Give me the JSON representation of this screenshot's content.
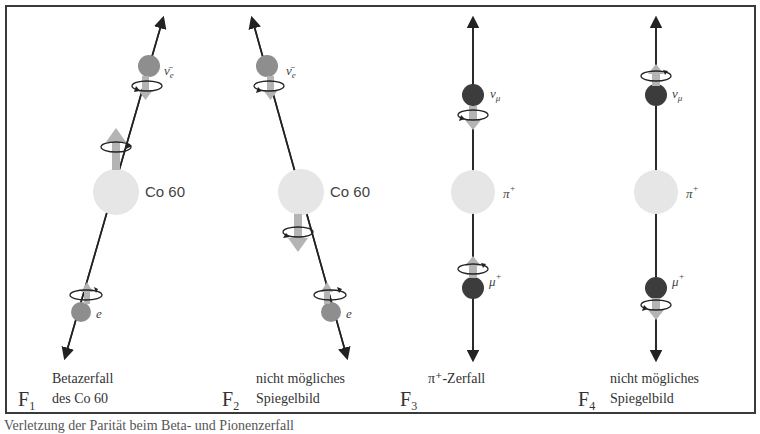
{
  "panels": [
    {
      "id": "F1",
      "figure_label": "F",
      "figure_index": "1",
      "caption_line1": "Betazerfall",
      "caption_line2": "des Co 60",
      "nucleus_label": "Co 60",
      "upper_particle_label": "ν̄e",
      "lower_particle_label": "e"
    },
    {
      "id": "F2",
      "figure_label": "F",
      "figure_index": "2",
      "caption_line1": "nicht mögliches",
      "caption_line2": "Spiegelbild",
      "nucleus_label": "Co 60",
      "upper_particle_label": "ν̄e",
      "lower_particle_label": "e"
    },
    {
      "id": "F3",
      "figure_label": "F",
      "figure_index": "3",
      "caption_line1": "π⁺-Zerfall",
      "caption_line2": "",
      "nucleus_label": "π⁺",
      "upper_particle_label": "νμ",
      "lower_particle_label": "μ⁺"
    },
    {
      "id": "F4",
      "figure_label": "F",
      "figure_index": "4",
      "caption_line1": "nicht mögliches",
      "caption_line2": "Spiegelbild",
      "nucleus_label": "π⁺",
      "upper_particle_label": "νμ",
      "lower_particle_label": "μ⁺"
    }
  ],
  "colors": {
    "frame": "#3a3a3a",
    "nucleus": "#e6e6e6",
    "electron_particle": "#8e8e8e",
    "muon_particle": "#3c3c3c",
    "spin_arrow": "#b4b4b4",
    "track": "#222222"
  },
  "footer_caption": "Verletzung der Parität beim Beta- und Pionenzerfall"
}
